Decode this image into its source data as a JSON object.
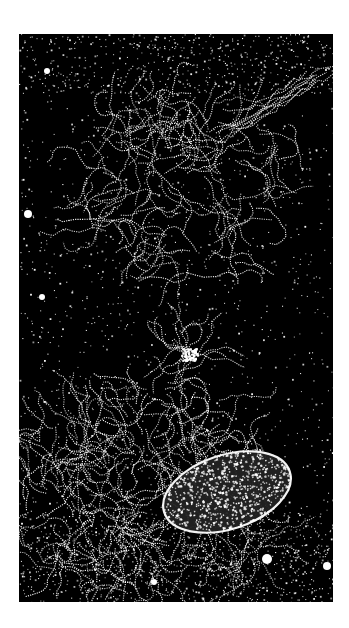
{
  "image": {
    "kind": "electron-micrograph",
    "description": "Spread chromatin / DNA fiber network released from a lysed bacterial cell, with an intact rod-shaped cell body at lower right",
    "background_color": "#000000",
    "speckle_color": "#ffffff",
    "page_background": "#ffffff",
    "frame": {
      "x": 19,
      "y": 34,
      "width": 314,
      "height": 568
    }
  },
  "features": {
    "upper_network": {
      "label": "upper fiber network",
      "cx": 165,
      "cy": 150,
      "rx": 105,
      "ry": 95
    },
    "upper_strand_tail": {
      "label": "diagonal fiber strands to upper right",
      "x1": 200,
      "y1": 60,
      "x2": 300,
      "y2": 40
    },
    "central_knot": {
      "label": "bright central aggregate",
      "cx": 170,
      "cy": 320
    },
    "lower_network": {
      "label": "lower dense fiber mass",
      "cx": 130,
      "cy": 460,
      "rx": 130,
      "ry": 120
    },
    "cell_body": {
      "label": "intact cell body",
      "cx": 208,
      "cy": 458,
      "rx": 66,
      "ry": 37,
      "rotation": -18
    },
    "debris": [
      {
        "cx": 9,
        "cy": 180,
        "r": 4
      },
      {
        "cx": 23,
        "cy": 263,
        "r": 3
      },
      {
        "cx": 28,
        "cy": 37,
        "r": 3
      },
      {
        "cx": 248,
        "cy": 525,
        "r": 5
      },
      {
        "cx": 308,
        "cy": 532,
        "r": 4
      },
      {
        "cx": 135,
        "cy": 548,
        "r": 3
      }
    ]
  },
  "caption_text": ""
}
